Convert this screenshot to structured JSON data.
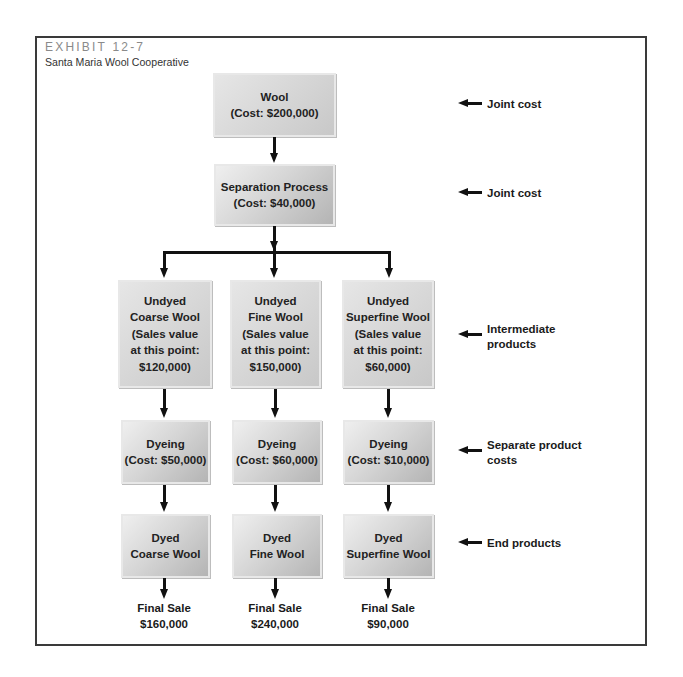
{
  "header": {
    "exhibit": "EXHIBIT 12-7",
    "subtitle": "Santa Maria Wool Cooperative"
  },
  "nodes": {
    "wool": {
      "lines": [
        "Wool",
        "(Cost: $200,000)"
      ]
    },
    "separation": {
      "lines": [
        "Separation Process",
        "(Cost: $40,000)"
      ]
    },
    "undyed": [
      {
        "lines": [
          "Undyed",
          "Coarse Wool",
          "(Sales value",
          "at this point:",
          "$120,000)"
        ]
      },
      {
        "lines": [
          "Undyed",
          "Fine Wool",
          "(Sales value",
          "at this point:",
          "$150,000)"
        ]
      },
      {
        "lines": [
          "Undyed",
          "Superfine Wool",
          "(Sales value",
          "at this point:",
          "$60,000)"
        ]
      }
    ],
    "dyeing": [
      {
        "lines": [
          "Dyeing",
          "(Cost: $50,000)"
        ]
      },
      {
        "lines": [
          "Dyeing",
          "(Cost: $60,000)"
        ]
      },
      {
        "lines": [
          "Dyeing",
          "(Cost: $10,000)"
        ]
      }
    ],
    "dyed": [
      {
        "lines": [
          "Dyed",
          "Coarse Wool"
        ]
      },
      {
        "lines": [
          "Dyed",
          "Fine Wool"
        ]
      },
      {
        "lines": [
          "Dyed",
          "Superfine Wool"
        ]
      }
    ],
    "final_sale": [
      {
        "label": "Final Sale",
        "value": "$160,000"
      },
      {
        "label": "Final Sale",
        "value": "$240,000"
      },
      {
        "label": "Final Sale",
        "value": "$90,000"
      }
    ]
  },
  "annotations": [
    {
      "lines": [
        "Joint cost"
      ]
    },
    {
      "lines": [
        "Joint cost"
      ]
    },
    {
      "lines": [
        "Intermediate",
        "products"
      ]
    },
    {
      "lines": [
        "Separate product",
        "costs"
      ]
    },
    {
      "lines": [
        "End products"
      ]
    }
  ]
}
